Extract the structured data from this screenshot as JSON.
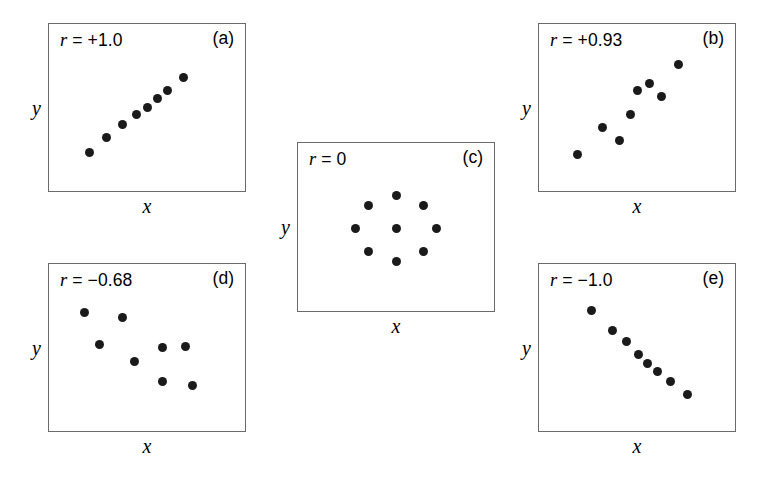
{
  "figure": {
    "background": "#ffffff",
    "dot_color": "#1a1a1a",
    "border_color": "#6b6b6b",
    "axis_label_x": "x",
    "axis_label_y": "y"
  },
  "chart_data": {
    "type": "scatter",
    "title": "",
    "xlabel": "x",
    "ylabel": "y",
    "grid": false,
    "legend": null,
    "axis_ticks": "none",
    "panels": [
      {
        "letter": "(a)",
        "r_symbol": "r",
        "r_text": "= +1.0",
        "r_value": 1.0,
        "xlabel": "x",
        "ylabel": "y",
        "n_points": 8,
        "xlim": [
          0,
          100
        ],
        "ylim": [
          0,
          100
        ],
        "points": [
          {
            "x": 17,
            "y": 18
          },
          {
            "x": 27,
            "y": 29
          },
          {
            "x": 36,
            "y": 38
          },
          {
            "x": 44,
            "y": 45
          },
          {
            "x": 50,
            "y": 50
          },
          {
            "x": 56,
            "y": 56
          },
          {
            "x": 62,
            "y": 62
          },
          {
            "x": 71,
            "y": 71
          }
        ]
      },
      {
        "letter": "(b)",
        "r_symbol": "r",
        "r_text": "= +0.93",
        "r_value": 0.93,
        "xlabel": "x",
        "ylabel": "y",
        "n_points": 8,
        "xlim": [
          0,
          100
        ],
        "ylim": [
          0,
          100
        ],
        "points": [
          {
            "x": 16,
            "y": 17
          },
          {
            "x": 30,
            "y": 36
          },
          {
            "x": 40,
            "y": 27
          },
          {
            "x": 46,
            "y": 45
          },
          {
            "x": 50,
            "y": 62
          },
          {
            "x": 57,
            "y": 67
          },
          {
            "x": 64,
            "y": 58
          },
          {
            "x": 74,
            "y": 80
          }
        ]
      },
      {
        "letter": "(c)",
        "r_symbol": "r",
        "r_text": "= 0",
        "r_value": 0,
        "xlabel": "x",
        "ylabel": "y",
        "n_points": 9,
        "xlim": [
          0,
          100
        ],
        "ylim": [
          0,
          100
        ],
        "points": [
          {
            "x": 50,
            "y": 72
          },
          {
            "x": 34,
            "y": 65
          },
          {
            "x": 66,
            "y": 65
          },
          {
            "x": 27,
            "y": 49
          },
          {
            "x": 50,
            "y": 49
          },
          {
            "x": 73,
            "y": 49
          },
          {
            "x": 34,
            "y": 33
          },
          {
            "x": 66,
            "y": 33
          },
          {
            "x": 50,
            "y": 26
          }
        ]
      },
      {
        "letter": "(d)",
        "r_symbol": "r",
        "r_text": "= −0.68",
        "r_value": -0.68,
        "xlabel": "x",
        "ylabel": "y",
        "n_points": 8,
        "xlim": [
          0,
          100
        ],
        "ylim": [
          0,
          100
        ],
        "points": [
          {
            "x": 14,
            "y": 75
          },
          {
            "x": 36,
            "y": 71
          },
          {
            "x": 23,
            "y": 52
          },
          {
            "x": 43,
            "y": 40
          },
          {
            "x": 59,
            "y": 50
          },
          {
            "x": 72,
            "y": 51
          },
          {
            "x": 59,
            "y": 26
          },
          {
            "x": 76,
            "y": 23
          }
        ]
      },
      {
        "letter": "(e)",
        "r_symbol": "r",
        "r_text": "= −1.0",
        "r_value": -1.0,
        "xlabel": "x",
        "ylabel": "y",
        "n_points": 8,
        "xlim": [
          0,
          100
        ],
        "ylim": [
          0,
          100
        ],
        "points": [
          {
            "x": 24,
            "y": 76
          },
          {
            "x": 36,
            "y": 62
          },
          {
            "x": 44,
            "y": 54
          },
          {
            "x": 51,
            "y": 45
          },
          {
            "x": 56,
            "y": 39
          },
          {
            "x": 62,
            "y": 33
          },
          {
            "x": 69,
            "y": 26
          },
          {
            "x": 79,
            "y": 17
          }
        ]
      }
    ]
  },
  "layout": {
    "panel_boxes": [
      {
        "left": 48,
        "top": 23,
        "width": 198,
        "height": 169
      },
      {
        "left": 538,
        "top": 23,
        "width": 198,
        "height": 169
      },
      {
        "left": 297,
        "top": 142,
        "width": 198,
        "height": 170
      },
      {
        "left": 48,
        "top": 263,
        "width": 198,
        "height": 169
      },
      {
        "left": 538,
        "top": 263,
        "width": 198,
        "height": 169
      }
    ]
  }
}
